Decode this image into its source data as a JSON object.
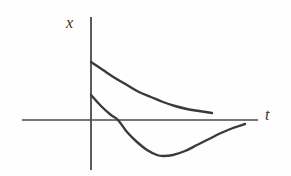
{
  "figure": {
    "kind": "line-plot",
    "background_color": "#fefefe",
    "stroke_color": "#3a3a3a",
    "axis_color": "#4a4a4a",
    "axis_label_color": "#333333",
    "vertical_axis_label": "x",
    "horizontal_axis_label": "t"
  },
  "chart_data": {
    "type": "line",
    "title": "",
    "subtitle": "",
    "xlabel": "t",
    "ylabel": "x",
    "grid": false,
    "legend": null,
    "annotations": [],
    "axes": {
      "x_axis": {
        "label": "t",
        "label_position": {
          "x": 268,
          "y": 118
        },
        "line": {
          "x1": 22,
          "y1": 120,
          "x2": 258,
          "y2": 120
        },
        "arrow": false,
        "ticks": [],
        "tick_labels": []
      },
      "y_axis": {
        "label": "x",
        "label_position": {
          "x": 72,
          "y": 24
        },
        "line": {
          "x1": 91,
          "y1": 17,
          "x2": 91,
          "y2": 170
        },
        "arrow": false,
        "ticks": [],
        "tick_labels": []
      },
      "origin": {
        "x": 91,
        "y": 120
      },
      "xlim": [
        22,
        258
      ],
      "ylim": [
        170,
        17
      ]
    },
    "series": [
      {
        "name": "upper-decay-curve",
        "description": "monotonically decreasing convex curve starting high on the x-axis and decaying toward the t-axis without crossing it",
        "color": "#3a3a3a",
        "linewidth": 2.4,
        "start_point": {
          "x": 91,
          "y": 62
        },
        "end_point": {
          "x": 212,
          "y": 113
        },
        "crosses_axis": false,
        "points": [
          {
            "x": 91,
            "y": 62
          },
          {
            "x": 103,
            "y": 70
          },
          {
            "x": 115,
            "y": 78
          },
          {
            "x": 127,
            "y": 85
          },
          {
            "x": 139,
            "y": 92
          },
          {
            "x": 151,
            "y": 97
          },
          {
            "x": 163,
            "y": 102
          },
          {
            "x": 175,
            "y": 106
          },
          {
            "x": 187,
            "y": 109
          },
          {
            "x": 199,
            "y": 111
          },
          {
            "x": 212,
            "y": 113
          }
        ]
      },
      {
        "name": "lower-undershoot-curve",
        "description": "curve starting above the t-axis, crossing it, dipping to a minimum below, then rising asymptotically back toward the t-axis",
        "color": "#3a3a3a",
        "linewidth": 2.4,
        "start_point": {
          "x": 91,
          "y": 95
        },
        "end_point": {
          "x": 245,
          "y": 124
        },
        "crosses_axis": true,
        "zero_crossing": {
          "x": 118,
          "y": 120
        },
        "minimum": {
          "x": 163,
          "y": 156
        },
        "points": [
          {
            "x": 91,
            "y": 95
          },
          {
            "x": 101,
            "y": 106
          },
          {
            "x": 111,
            "y": 115
          },
          {
            "x": 118,
            "y": 120
          },
          {
            "x": 127,
            "y": 132
          },
          {
            "x": 137,
            "y": 142
          },
          {
            "x": 147,
            "y": 150
          },
          {
            "x": 157,
            "y": 155
          },
          {
            "x": 163,
            "y": 156
          },
          {
            "x": 173,
            "y": 155
          },
          {
            "x": 185,
            "y": 151
          },
          {
            "x": 197,
            "y": 145
          },
          {
            "x": 209,
            "y": 139
          },
          {
            "x": 221,
            "y": 133
          },
          {
            "x": 233,
            "y": 128
          },
          {
            "x": 245,
            "y": 124
          }
        ]
      }
    ]
  }
}
